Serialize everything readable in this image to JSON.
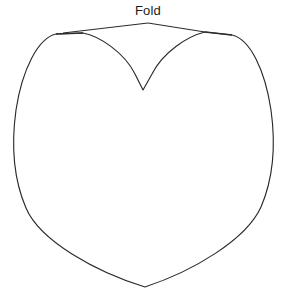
{
  "document": {
    "type": "pattern-template",
    "title": "Heart Pattern Template",
    "background_color": "#ffffff",
    "line_color": "#2b2b2b",
    "width": 286,
    "height": 299
  },
  "annotations": {
    "fold": {
      "label": "Fold",
      "label_x": 148,
      "label_y": 15,
      "font_size": 13,
      "color": "#1c1c1c",
      "leader_apex_x": 148,
      "leader_apex_y": 23,
      "leader_left_end_x": 63,
      "leader_left_end_y": 33,
      "leader_right_end_x": 205,
      "leader_right_end_y": 32
    }
  },
  "shape": {
    "name": "heart",
    "description": "Symmetric heart outline with flat fold edge across the top and a V cleft at center",
    "bottom_point_x": 145,
    "bottom_point_y": 287,
    "cleft_point_x": 143,
    "cleft_point_y": 90,
    "left_extreme_x": 14,
    "left_extreme_y": 150,
    "right_extreme_x": 272,
    "right_extreme_y": 150,
    "top_left_corner_x": 56,
    "top_left_corner_y": 34,
    "top_right_corner_x": 232,
    "top_right_corner_y": 35,
    "outline_path": "M 56 34 C 38 38 22 70 16 110 C 11 146 14 180 26 208 C 40 241 96 272 145 287 C 193 271 246 240 261 207 C 273 179 276 146 271 110 C 265 70 250 39 232 35 L 205 32 C 188 36 163 52 152 74 L 143 90 L 135 74 C 124 52 99 36 83 33 Z",
    "fold_edge_left_path": "M 56 34 L 83 33",
    "fold_edge_right_path": "M 205 32 L 232 35"
  }
}
